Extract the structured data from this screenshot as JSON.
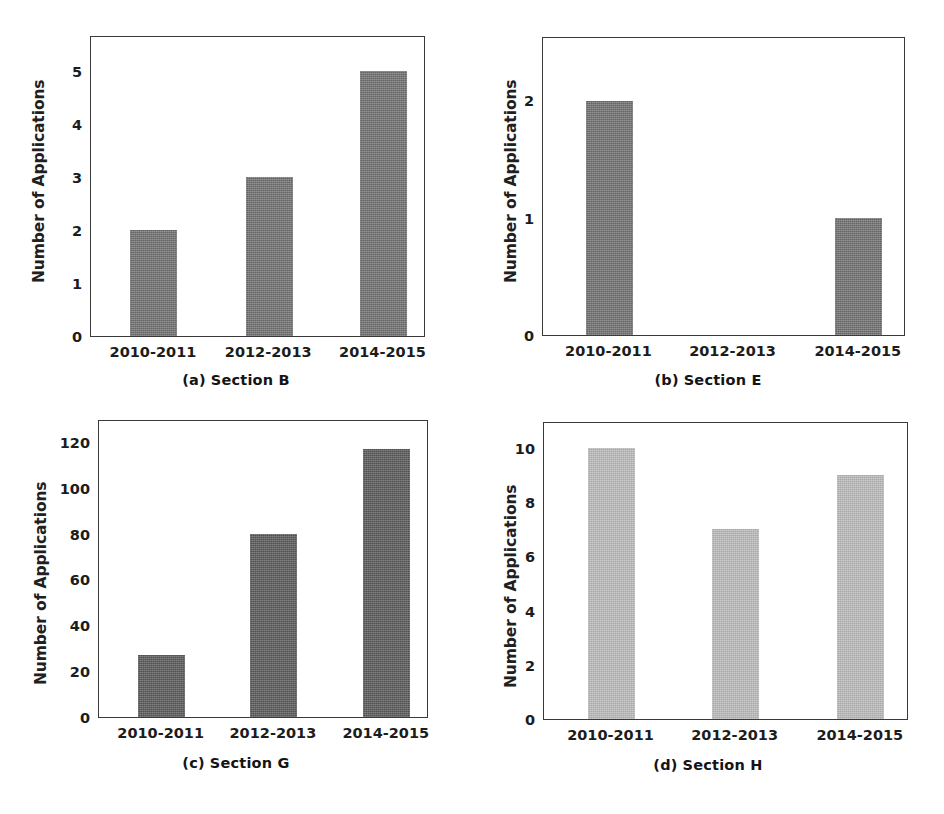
{
  "figure": {
    "background_color": "#ffffff",
    "axis_color": "#3a3a3a",
    "text_color": "#1c1c1c",
    "panels": [
      {
        "id": "a",
        "caption_id": "(a)",
        "caption_text": "Section B",
        "caption_full": "(a)  Section B",
        "bar_color": "#6e6e6e",
        "chart_data": {
          "type": "bar",
          "title": "(a) Section B",
          "xlabel": "",
          "ylabel": "Number of Applications",
          "categories": [
            "2010-2011",
            "2012-2013",
            "2014-2015"
          ],
          "values": [
            2,
            3,
            5
          ],
          "yticks": [
            0,
            1,
            2,
            3,
            4,
            5
          ],
          "ytick_labels": [
            "0",
            "1",
            "2",
            "3",
            "4",
            "5"
          ],
          "ylim": [
            0,
            5.68
          ],
          "grid": false,
          "legend": false
        }
      },
      {
        "id": "b",
        "caption_id": "(b)",
        "caption_text": "Section E",
        "caption_full": "(b)  Section E",
        "bar_color": "#6e6e6e",
        "chart_data": {
          "type": "bar",
          "title": "(b) Section E",
          "xlabel": "",
          "ylabel": "Number of Applications",
          "categories": [
            "2010-2011",
            "2012-2013",
            "2014-2015"
          ],
          "values": [
            2,
            0,
            1
          ],
          "yticks": [
            0,
            1,
            2
          ],
          "ytick_labels": [
            "0",
            "1",
            "2"
          ],
          "ylim": [
            0,
            2.55
          ],
          "grid": false,
          "legend": false
        }
      },
      {
        "id": "c",
        "caption_id": "(c)",
        "caption_text": "Section G",
        "caption_full": "(c)  Section G",
        "bar_color": "#575757",
        "chart_data": {
          "type": "bar",
          "title": "(c) Section G",
          "xlabel": "",
          "ylabel": "Number of Applications",
          "categories": [
            "2010-2011",
            "2012-2013",
            "2014-2015"
          ],
          "values": [
            27,
            80,
            117
          ],
          "yticks": [
            0,
            20,
            40,
            60,
            80,
            100,
            120
          ],
          "ytick_labels": [
            "0",
            "20",
            "40",
            "60",
            "80",
            "100",
            "120"
          ],
          "ylim": [
            0,
            130
          ],
          "grid": false,
          "legend": false
        }
      },
      {
        "id": "d",
        "caption_id": "(d)",
        "caption_text": "Section H",
        "caption_full": "(d)  Section H",
        "bar_color": "#b9b9b9",
        "chart_data": {
          "type": "bar",
          "title": "(d) Section H",
          "xlabel": "",
          "ylabel": "Number of Applications",
          "categories": [
            "2010-2011",
            "2012-2013",
            "2014-2015"
          ],
          "values": [
            10,
            7,
            9
          ],
          "yticks": [
            0,
            2,
            4,
            6,
            8,
            10
          ],
          "ytick_labels": [
            "0",
            "2",
            "4",
            "6",
            "8",
            "10"
          ],
          "ylim": [
            0,
            11.0
          ],
          "grid": false,
          "legend": false
        }
      }
    ]
  },
  "chart_data": [
    {
      "type": "bar",
      "title": "(a) Section B",
      "xlabel": "",
      "ylabel": "Number of Applications",
      "categories": [
        "2010-2011",
        "2012-2013",
        "2014-2015"
      ],
      "values": [
        2,
        3,
        5
      ],
      "ylim": [
        0,
        5.68
      ],
      "yticks": [
        0,
        1,
        2,
        3,
        4,
        5
      ],
      "grid": false,
      "legend": false
    },
    {
      "type": "bar",
      "title": "(b) Section E",
      "xlabel": "",
      "ylabel": "Number of Applications",
      "categories": [
        "2010-2011",
        "2012-2013",
        "2014-2015"
      ],
      "values": [
        2,
        0,
        1
      ],
      "ylim": [
        0,
        2.55
      ],
      "yticks": [
        0,
        1,
        2
      ],
      "grid": false,
      "legend": false
    },
    {
      "type": "bar",
      "title": "(c) Section G",
      "xlabel": "",
      "ylabel": "Number of Applications",
      "categories": [
        "2010-2011",
        "2012-2013",
        "2014-2015"
      ],
      "values": [
        27,
        80,
        117
      ],
      "ylim": [
        0,
        130
      ],
      "yticks": [
        0,
        20,
        40,
        60,
        80,
        100,
        120
      ],
      "grid": false,
      "legend": false
    },
    {
      "type": "bar",
      "title": "(d) Section H",
      "xlabel": "",
      "ylabel": "Number of Applications",
      "categories": [
        "2010-2011",
        "2012-2013",
        "2014-2015"
      ],
      "values": [
        10,
        7,
        9
      ],
      "ylim": [
        0,
        11.0
      ],
      "yticks": [
        0,
        2,
        4,
        6,
        8,
        10
      ],
      "grid": false,
      "legend": false
    }
  ]
}
